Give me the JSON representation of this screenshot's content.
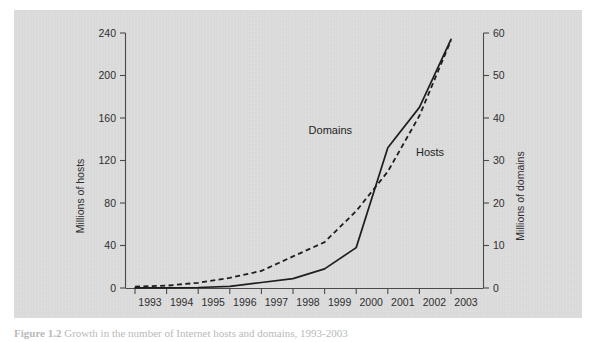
{
  "figure": {
    "caption_label": "Figure 1.2",
    "caption_text": "Growth in the number of Internet hosts and domains, 1993-2003",
    "panel_color": "#dddddd",
    "page_color": "#ffffff"
  },
  "chart_data": {
    "type": "line",
    "title": "",
    "subtitle": "",
    "xlabel": "",
    "ylabel": "Millions of hosts",
    "y2label": "Millions of domains",
    "grid": false,
    "legend": "inline-annotations",
    "x": [
      1993,
      1994,
      1995,
      1996,
      1997,
      1998,
      1999,
      2000,
      2001,
      2002,
      2003
    ],
    "categories": [
      "1993",
      "1994",
      "1995",
      "1996",
      "1997",
      "1998",
      "1999",
      "2000",
      "2001",
      "2002",
      "2003"
    ],
    "xlim": [
      1992.7,
      2003.6
    ],
    "ylim": [
      0,
      240
    ],
    "y2lim": [
      0,
      60
    ],
    "yticks": [
      0,
      40,
      80,
      120,
      160,
      200,
      240
    ],
    "y2ticks": [
      0,
      10,
      20,
      30,
      40,
      50,
      60
    ],
    "series": [
      {
        "name": "Hosts",
        "axis": "left",
        "style": "dashed",
        "units": "millions",
        "values": [
          1.3,
          2.2,
          4.9,
          9.5,
          16.1,
          29.7,
          43.2,
          72.4,
          109.6,
          162.1,
          233.1
        ]
      },
      {
        "name": "Domains",
        "axis": "right",
        "style": "solid",
        "units": "millions",
        "values": [
          0.02,
          0.05,
          0.12,
          0.4,
          1.3,
          2.2,
          4.5,
          9.5,
          33.0,
          42.5,
          58.5
        ]
      }
    ],
    "annotations": [
      {
        "text": "Domains",
        "series": "Domains",
        "x_px": 352,
        "y_px": 134
      },
      {
        "text": "Hosts",
        "series": "Hosts",
        "x_px": 416,
        "y_px": 156
      }
    ]
  }
}
